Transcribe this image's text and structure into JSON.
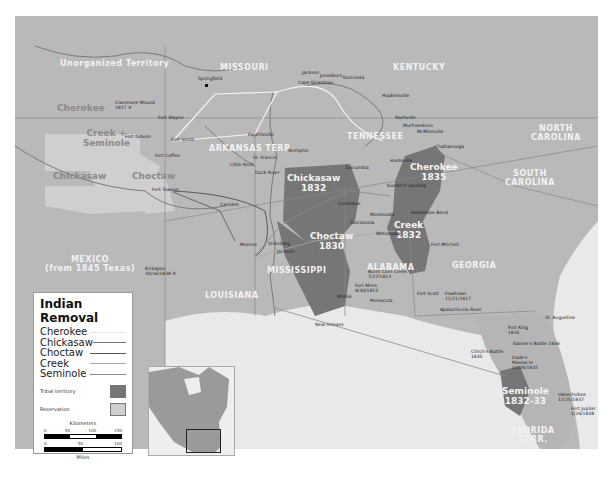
{
  "map": {
    "title": "Indian Removal",
    "colors": {
      "land": "#b9b9b9",
      "water": "#e9e9e9",
      "tribal_territory": "#767676",
      "reservation": "#cfcfcf",
      "route_white": "#f4f4f4",
      "route_dark": "#5a5a5a"
    },
    "regions": {
      "unorganized": "Unorganized Territory",
      "missouri": "MISSOURI",
      "kentucky": "KENTUCKY",
      "tennessee": "TENNESSEE",
      "arkansas": "ARKANSAS TERR.",
      "north_carolina_1": "NORTH",
      "north_carolina_2": "CAROLINA",
      "south_carolina_1": "SOUTH",
      "south_carolina_2": "CAROLINA",
      "mexico_1": "MEXICO",
      "mexico_2": "(from 1845 Texas)",
      "louisiana": "LOUISIANA",
      "mississippi": "MISSISSIPPI",
      "alabama": "ALABAMA",
      "georgia": "GEORGIA",
      "florida_1": "FLORIDA",
      "florida_2": "TERR."
    },
    "reservations": {
      "cherokee": "Cherokee",
      "creek_seminole_1": "Creek +",
      "creek_seminole_2": "Seminole",
      "chickasaw": "Chickasaw",
      "choctaw": "Choctaw"
    },
    "territories": {
      "chickasaw_name": "Chickasaw",
      "chickasaw_year": "1832",
      "choctaw_name": "Choctaw",
      "choctaw_year": "1830",
      "cherokee_name": "Cherokee",
      "cherokee_year": "1835",
      "creek_name": "Creek",
      "creek_year": "1832",
      "seminole_name": "Seminole",
      "seminole_year": "1832-33"
    },
    "places": {
      "claremore_1": "Claremore Mound",
      "claremore_2": "1817 ✕",
      "springfield": "Springfield",
      "fort_wayne": "Fort Wayne",
      "fort_gibson": "Fort Gibson",
      "fort_smith_ar": "Fort Smith",
      "fort_coffee": "Fort Coffee",
      "fayetteville": "Fayetteville",
      "little_rock": "Little Rock",
      "st_francis": "St. Francis",
      "duck_river": "Duck River",
      "memphis": "Memphis",
      "jackson": "Jackson",
      "jonesboro": "Jonesboro",
      "golconda": "Golconda",
      "cape_girardeau": "Cape Girardeau",
      "hopkinsville": "Hopkinsville",
      "nashville": "Nashville",
      "murfreesboro": "Murfreesboro",
      "mcminnville": "McMinnville",
      "chattanooga": "Chattanooga",
      "fort_towson": "Fort Towson",
      "camden": "Camden",
      "monroe": "Monroe",
      "vicksburg": "Vicksburg",
      "jackson_ms": "Jackson",
      "columbus": "Columbus",
      "tuscumbia": "Tuscumbia",
      "huntsville": "Huntsville",
      "gunters_landing": "Gunter's Landing",
      "tuscaloosa": "Tuscaloosa",
      "montevallo": "Montevallo",
      "wetumpka": "Wetumpka",
      "fort_mitchell": "Fort Mitchell",
      "horseshoe_bend": "Horseshoe Bend",
      "burnt_corn_1": "Burnt Corn Creek",
      "burnt_corn_2": "7/27/1813",
      "fort_mims_1": "Fort Mims",
      "fort_mims_2": "8/30/1813",
      "mobile": "Mobile",
      "pensacola": "Pensacola",
      "fort_scott": "Fort Scott",
      "fowltown_1": "Fowltown",
      "fowltown_2": "11/21/1817",
      "apalachicola": "Apalachicola River",
      "new_orleans": "New Orleans",
      "st_augustine": "St. Augustine",
      "fort_king_1": "Fort King",
      "fort_king_2": "1835",
      "gaines_battle": "Gaines's Battle 1836",
      "clinch_1": "Clinch's Battle",
      "clinch_2": "1835",
      "dade_1": "Dade's",
      "dade_2": "Massacre",
      "dade_3": "12/28/1835",
      "okeechobee_1": "Okeechobee",
      "okeechobee_2": "12/25/1837",
      "jupiter_1": "Fort Jupiter",
      "jupiter_2": "1/24/1838",
      "texas_battle_1": "Kickapoo",
      "texas_battle_2": "10/16/1838 ✕"
    },
    "legend": {
      "title": "Indian Removal",
      "routes": [
        {
          "label": "Cherokee",
          "color": "#f0f0f0"
        },
        {
          "label": "Chickasaw",
          "color": "#777777"
        },
        {
          "label": "Choctaw",
          "color": "#555555"
        },
        {
          "label": "Creek",
          "color": "#aaaaaa"
        },
        {
          "label": "Seminole",
          "color": "#8c8c8c"
        }
      ],
      "tribal_territory": "Tribal territory",
      "reservation": "Reservation",
      "km_label": "Kilometers",
      "km_ticks": [
        "0",
        "50",
        "100",
        "150"
      ],
      "mi_ticks": [
        "0",
        "50",
        "100"
      ],
      "mi_label": "Miles"
    }
  }
}
